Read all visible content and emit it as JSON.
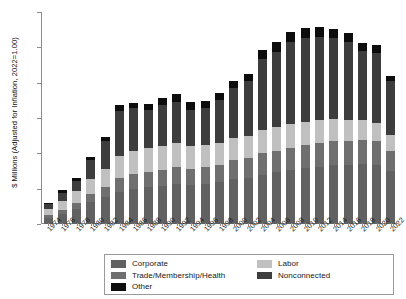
{
  "chart_data": {
    "type": "bar",
    "title": "",
    "subtitle": "",
    "stacked": true,
    "xlabel": "",
    "ylabel": "$ Millions (Adjusted for Inflation, 2022=1.00)",
    "ylim": [
      0,
      600
    ],
    "yticks": [
      0,
      100,
      200,
      300,
      400,
      500,
      600
    ],
    "grid": false,
    "legend_position": "bottom",
    "categories": [
      "1974",
      "1976",
      "1978",
      "1980",
      "1982",
      "1984",
      "1986",
      "1988",
      "1990",
      "1992",
      "1994",
      "1996",
      "1998",
      "2000",
      "2002",
      "2004",
      "2006",
      "2008",
      "2010",
      "2012",
      "2014",
      "2016",
      "2018",
      "2020",
      "2022"
    ],
    "series": [
      {
        "name": "Corporate",
        "color": "#616161",
        "values": [
          18,
          28,
          42,
          62,
          76,
          92,
          100,
          104,
          108,
          112,
          110,
          112,
          118,
          126,
          130,
          140,
          146,
          152,
          158,
          162,
          166,
          168,
          170,
          168,
          150
        ]
      },
      {
        "name": "Trade/Membership/Health",
        "color": "#6f6f6f",
        "values": [
          8,
          12,
          18,
          24,
          30,
          38,
          42,
          44,
          46,
          48,
          46,
          48,
          50,
          54,
          56,
          60,
          62,
          64,
          66,
          68,
          68,
          68,
          68,
          66,
          58
        ]
      },
      {
        "name": "Labor",
        "color": "#c0c0c0",
        "values": [
          16,
          26,
          34,
          42,
          50,
          62,
          66,
          66,
          66,
          68,
          64,
          64,
          62,
          64,
          64,
          66,
          66,
          66,
          64,
          64,
          62,
          58,
          56,
          52,
          44
        ]
      },
      {
        "name": "Nonconnected",
        "color": "#3d3d3d",
        "values": [
          14,
          22,
          28,
          52,
          78,
          128,
          120,
          108,
          116,
          118,
          104,
          104,
          120,
          140,
          154,
          202,
          212,
          232,
          238,
          236,
          230,
          222,
          196,
          198,
          152
        ]
      },
      {
        "name": "Other",
        "color": "#0d0d0d",
        "values": [
          4,
          7,
          8,
          10,
          12,
          16,
          16,
          18,
          20,
          22,
          20,
          20,
          20,
          22,
          22,
          26,
          28,
          30,
          30,
          28,
          26,
          24,
          22,
          22,
          14
        ]
      }
    ],
    "totals": [
      60,
      95,
      130,
      190,
      246,
      336,
      344,
      340,
      356,
      368,
      344,
      348,
      370,
      406,
      426,
      494,
      514,
      544,
      556,
      558,
      552,
      540,
      512,
      506,
      418
    ]
  },
  "axes": {
    "y_label": "$ Millions (Adjusted for Inflation, 2022=1.00)",
    "y_ticks": [
      "0",
      "100",
      "200",
      "300",
      "400",
      "500",
      "600"
    ],
    "x_ticks": [
      "1974",
      "1976",
      "1978",
      "1980",
      "1982",
      "1984",
      "1986",
      "1988",
      "1990",
      "1992",
      "1994",
      "1996",
      "1998",
      "2000",
      "2002",
      "2004",
      "2006",
      "2008",
      "2010",
      "2012",
      "2014",
      "2016",
      "2018",
      "2020",
      "2022"
    ]
  },
  "legend": {
    "left_column": [
      {
        "label": "Corporate",
        "color": "#616161"
      },
      {
        "label": "Trade/Membership/Health",
        "color": "#6f6f6f"
      },
      {
        "label": "Other",
        "color": "#0d0d0d"
      }
    ],
    "right_column": [
      {
        "label": "Labor",
        "color": "#c0c0c0"
      },
      {
        "label": "Nonconnected",
        "color": "#3d3d3d"
      }
    ]
  }
}
